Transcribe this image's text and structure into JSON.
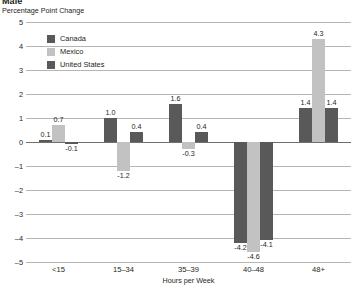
{
  "chart_data": {
    "type": "bar",
    "title": "Male",
    "subtitle": "Percentage Point Change",
    "xlabel": "Hours per Week",
    "ylabel": "",
    "categories": [
      "<15",
      "15–34",
      "35–39",
      "40–48",
      "48+"
    ],
    "series": [
      {
        "name": "Canada",
        "color": "#595959",
        "values": [
          0.1,
          1.0,
          1.6,
          -4.2,
          1.4
        ]
      },
      {
        "name": "Mexico",
        "color": "#c2c2c2",
        "values": [
          0.7,
          -1.2,
          -0.3,
          -4.6,
          4.3
        ]
      },
      {
        "name": "United States",
        "color": "#595959",
        "values": [
          -0.1,
          0.4,
          0.4,
          -4.1,
          1.4
        ]
      }
    ],
    "value_labels": [
      [
        "0.1",
        "0.7",
        "-0.1"
      ],
      [
        "1.0",
        "-1.2",
        "0.4"
      ],
      [
        "1.6",
        "-0.3",
        "0.4"
      ],
      [
        "-4.2",
        "-4.6",
        "-4.1"
      ],
      [
        "1.4",
        "4.3",
        "1.4"
      ]
    ],
    "ylim": [
      -5,
      5
    ],
    "yticks": [
      5,
      4,
      3,
      2,
      1,
      0,
      -1,
      -2,
      -3,
      -4,
      -5
    ],
    "ytick_labels": [
      "5",
      "4",
      "3",
      "2",
      "1",
      "0",
      "–1",
      "–2",
      "–3",
      "–4",
      "–5"
    ],
    "grid": true,
    "legend_position": "top-left",
    "zero_line": true
  },
  "legend": {
    "items": [
      {
        "label": "Canada"
      },
      {
        "label": "Mexico"
      },
      {
        "label": "United States"
      }
    ]
  }
}
